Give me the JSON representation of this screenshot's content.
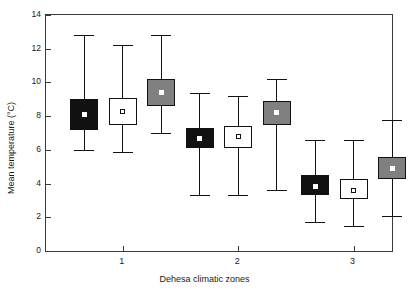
{
  "chart_data": {
    "type": "box",
    "title": "",
    "xlabel": "Dehesa climatic zones",
    "ylabel": "Mean temperature (°C)",
    "ylim": [
      0,
      14
    ],
    "yticks": [
      0,
      2,
      4,
      6,
      8,
      10,
      12,
      14
    ],
    "ytick_labels": [
      "0",
      "2",
      "4",
      "6",
      "8",
      "10",
      "12",
      "14"
    ],
    "xlim": [
      0,
      9
    ],
    "xticks": [
      2,
      5,
      8
    ],
    "xtick_labels": [
      "1",
      "2",
      "3"
    ],
    "grid": false,
    "legend": null,
    "boxes": [
      {
        "name": "zone1-black",
        "x": 1,
        "fill": "#111111",
        "center_style": "filled-white-square",
        "whisker_low": 6.0,
        "q1": 7.2,
        "median": 8.1,
        "q3": 9.0,
        "whisker_high": 12.8
      },
      {
        "name": "zone1-white",
        "x": 2,
        "fill": "#ffffff",
        "center_style": "open-square",
        "whisker_low": 5.9,
        "q1": 7.5,
        "median": 8.3,
        "q3": 9.1,
        "whisker_high": 12.2
      },
      {
        "name": "zone1-gray",
        "x": 3,
        "fill": "#808080",
        "center_style": "filled-white-square",
        "whisker_low": 7.0,
        "q1": 8.6,
        "median": 9.4,
        "q3": 10.2,
        "whisker_high": 12.8
      },
      {
        "name": "zone2-black",
        "x": 4,
        "fill": "#111111",
        "center_style": "filled-white-square",
        "whisker_low": 3.3,
        "q1": 6.1,
        "median": 6.7,
        "q3": 7.3,
        "whisker_high": 9.4
      },
      {
        "name": "zone2-white",
        "x": 5,
        "fill": "#ffffff",
        "center_style": "open-square",
        "whisker_low": 3.3,
        "q1": 6.1,
        "median": 6.8,
        "q3": 7.4,
        "whisker_high": 9.2
      },
      {
        "name": "zone2-gray",
        "x": 6,
        "fill": "#808080",
        "center_style": "filled-white-square",
        "whisker_low": 3.6,
        "q1": 7.5,
        "median": 8.2,
        "q3": 8.9,
        "whisker_high": 10.2
      },
      {
        "name": "zone3-black",
        "x": 7,
        "fill": "#111111",
        "center_style": "filled-white-square",
        "whisker_low": 1.7,
        "q1": 3.3,
        "median": 3.8,
        "q3": 4.5,
        "whisker_high": 6.6
      },
      {
        "name": "zone3-white",
        "x": 8,
        "fill": "#ffffff",
        "center_style": "open-square",
        "whisker_low": 1.5,
        "q1": 3.1,
        "median": 3.6,
        "q3": 4.3,
        "whisker_high": 6.6
      },
      {
        "name": "zone3-gray",
        "x": 9,
        "fill": "#808080",
        "center_style": "filled-white-square",
        "whisker_low": 2.1,
        "q1": 4.3,
        "median": 4.9,
        "q3": 5.6,
        "whisker_high": 7.8
      }
    ]
  }
}
